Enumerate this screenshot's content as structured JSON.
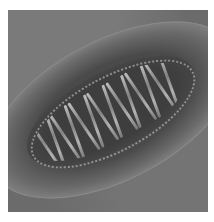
{
  "image": {
    "description": "Grayscale electron micrograph of an elongated oval organelle with internal cristae-like folds",
    "colors": {
      "background": "#6e6e6e",
      "outer_halo": "#9a9a9a",
      "interior": "#3e3e3e",
      "highlights": "#e8e8e8",
      "page": "#ffffff"
    },
    "crista_count": 14
  }
}
